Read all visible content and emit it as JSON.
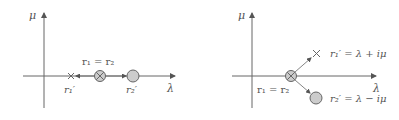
{
  "colors": {
    "axis": "#666666",
    "text": "#555555",
    "circle_fill": "#cccccc",
    "circle_stroke": "#666666"
  },
  "left_diagram": {
    "y_axis_label": "μ",
    "x_axis_label": "λ",
    "double_root_label": "r₁ = r₂",
    "root1_label": "r₁′",
    "root2_label": "r₂′"
  },
  "right_diagram": {
    "y_axis_label": "μ",
    "x_axis_label": "λ",
    "double_root_label": "r₁ = r₂",
    "root1_label": "r₁′ = λ + iμ",
    "root2_label": "r₂′ = λ − iμ"
  }
}
